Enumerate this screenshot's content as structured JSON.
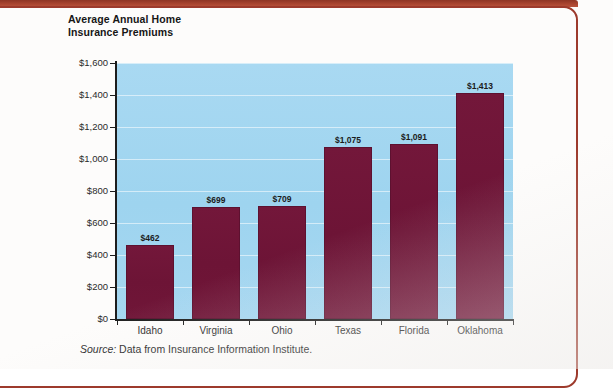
{
  "figure": {
    "title_line1": "Average Annual Home",
    "title_line2": "Insurance Premiums",
    "source_label": "Source:",
    "source_text": "Data from Insurance Information Institute.",
    "plot_background": "#a4d6f0",
    "bar_color": "#701638",
    "frame_color": "#9d3a2c"
  },
  "chart_data": {
    "type": "bar",
    "title": "Average Annual Home Insurance Premiums",
    "xlabel": "",
    "ylabel": "",
    "categories": [
      "Idaho",
      "Virginia",
      "Ohio",
      "Texas",
      "Florida",
      "Oklahoma"
    ],
    "values": [
      462,
      699,
      709,
      1075,
      1091,
      1413
    ],
    "data_labels": [
      "$462",
      "$699",
      "$709",
      "$1,075",
      "$1,091",
      "$1,413"
    ],
    "ylim": [
      0,
      1600
    ],
    "ytick_values": [
      0,
      200,
      400,
      600,
      800,
      1000,
      1200,
      1400,
      1600
    ],
    "ytick_labels": [
      "$0",
      "$200",
      "$400",
      "$600",
      "$800",
      "$1,000",
      "$1,200",
      "$1,400",
      "$1,600"
    ],
    "grid": true,
    "legend": false,
    "source": "Data from Insurance Information Institute."
  }
}
